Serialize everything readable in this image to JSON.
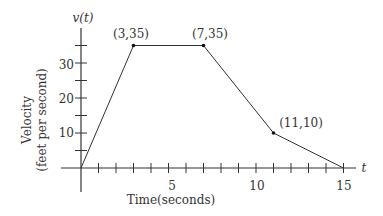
{
  "chart_data": {
    "type": "line",
    "title": "",
    "xlabel": "Time(seconds)",
    "ylabel": "Velocity (feet per second)",
    "ylabel_line1": "Velocity",
    "ylabel_line2": "(feet per second)",
    "x_axis_name": "t",
    "y_axis_name": "v(t)",
    "xlim": [
      0,
      15
    ],
    "ylim": [
      0,
      40
    ],
    "x_ticks": [
      "5",
      "10",
      "15"
    ],
    "y_ticks": [
      "10",
      "20",
      "30"
    ],
    "series": [
      {
        "name": "v(t)",
        "x": [
          0,
          3,
          7,
          11,
          15
        ],
        "values": [
          0,
          35,
          35,
          10,
          0
        ]
      }
    ],
    "annotations": [
      {
        "text": "(3,35)",
        "x": 3,
        "y": 35
      },
      {
        "text": "(7,35)",
        "x": 7,
        "y": 35
      },
      {
        "text": "(11,10)",
        "x": 11,
        "y": 10
      }
    ],
    "grid": false,
    "legend": "none"
  }
}
